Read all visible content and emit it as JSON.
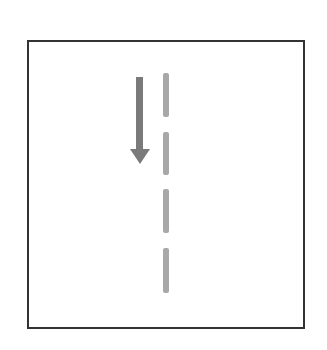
{
  "diagram": {
    "frame": {
      "border_color": "#333333"
    },
    "arrow": {
      "direction": "down",
      "color": "#7a7a7a"
    },
    "dashed_line": {
      "orientation": "vertical",
      "color": "#a8a8a8",
      "segments": 4
    }
  }
}
